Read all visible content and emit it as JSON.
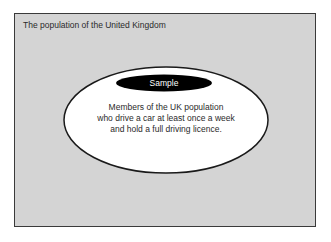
{
  "diagram": {
    "type": "nested-sets",
    "outer_set": {
      "label": "The population of the United Kingdom",
      "shape": "rectangle",
      "fill": "#d4d4d4",
      "stroke": "#3a3a3a"
    },
    "inner_set": {
      "label": "Sample",
      "shape": "ellipse",
      "fill": "#ffffff",
      "stroke": "#1a1a1a",
      "label_fill": "#000000",
      "label_color": "#ffffff",
      "description_lines": [
        "Members of the UK population",
        "who drive a car at least once a week",
        "and hold a full driving licence."
      ]
    }
  }
}
